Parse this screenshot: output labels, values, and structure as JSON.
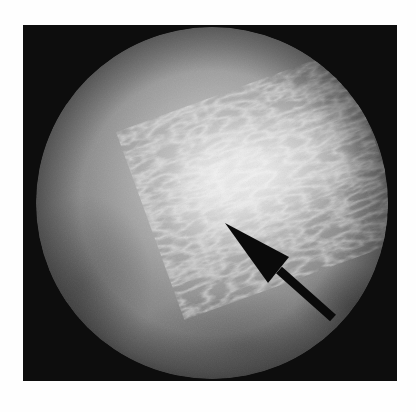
{
  "figure": {
    "description": "Grayscale endoscopic view with black arrow annotation",
    "background_color": "#0d0d0d",
    "scope_circle": {
      "cx": 189,
      "cy": 178,
      "r": 176
    },
    "tissue_colors": {
      "base": "#8a8a8a",
      "highlight": "#e6e6e6",
      "shadow": "#5a5a5a",
      "edge": "#6a6a6a"
    },
    "annotation": {
      "type": "arrow",
      "color": "#0a0a0a",
      "tip": [
        202,
        198
      ],
      "tail": [
        310,
        295
      ]
    }
  }
}
